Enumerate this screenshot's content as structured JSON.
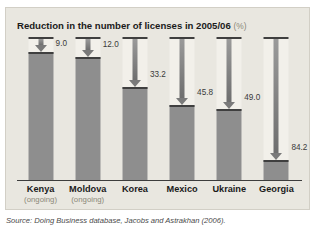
{
  "clipped_heading": "Big cuts in licensing requirements",
  "chart_title": "Reduction in the number of licenses in 2005/06",
  "chart_unit": "(%)",
  "source": "Source: Doing Business database, Jacobs and Astrakhan (2006).",
  "chart_data": {
    "type": "bar",
    "title": "Reduction in the number of licenses in 2005/06 (%)",
    "xlabel": "",
    "ylabel": "Reduction (%)",
    "ylim": [
      0,
      100
    ],
    "grid": false,
    "legend": "none",
    "categories": [
      "Kenya",
      "Moldova",
      "Korea",
      "Mexico",
      "Ukraine",
      "Georgia"
    ],
    "category_notes": [
      "(ongoing)",
      "(ongoing)",
      "",
      "",
      "",
      ""
    ],
    "values": [
      9.0,
      12.0,
      33.2,
      45.8,
      49.0,
      84.2
    ],
    "value_labels": [
      "9.0",
      "12.0",
      "33.2",
      "45.8",
      "49.0",
      "84.2"
    ],
    "annotation": "Downward arrow length encodes the percentage reduction; the solid column below the arrow is the remaining share."
  },
  "colors": {
    "panel_background": "#e9e7e0",
    "column_channel": "#f2f0ea",
    "bar_fill": "#8e8e8e",
    "rule": "#3f3f3f",
    "arrow": "#7a7a7a",
    "muted_text": "#8c8778",
    "text": "#1b1b1b"
  }
}
